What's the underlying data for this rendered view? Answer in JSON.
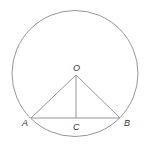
{
  "diagram": {
    "type": "geometry",
    "colors": {
      "stroke": "#8a8a8a",
      "label": "#333333",
      "background": "#ffffff"
    },
    "circle": {
      "cx": 75,
      "cy": 73.5,
      "r": 63
    },
    "points": {
      "O": {
        "label": "O",
        "x": 76,
        "y": 75
      },
      "A": {
        "label": "A",
        "x": 31,
        "y": 118
      },
      "B": {
        "label": "B",
        "x": 120,
        "y": 118
      },
      "C": {
        "label": "C",
        "x": 76,
        "y": 118
      }
    },
    "segments": [
      {
        "from": "O",
        "to": "A"
      },
      {
        "from": "O",
        "to": "B"
      },
      {
        "from": "A",
        "to": "B"
      },
      {
        "from": "O",
        "to": "C"
      }
    ],
    "labels": {
      "O": "O",
      "A": "A",
      "B": "B",
      "C": "C"
    }
  }
}
